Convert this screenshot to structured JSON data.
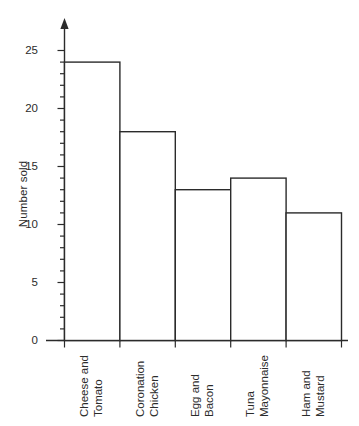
{
  "chart_data": {
    "type": "bar",
    "title": "",
    "xlabel": "",
    "ylabel": "Number sold",
    "categories": [
      "Cheese and Tomato",
      "Coronation Chicken",
      "Egg and Bacon",
      "Tuna Mayonnaise",
      "Ham and Mustard"
    ],
    "category_lines": [
      [
        "Cheese and",
        "Tomato"
      ],
      [
        "Coronation",
        "Chicken"
      ],
      [
        "Egg and",
        "Bacon"
      ],
      [
        "Tuna",
        "Mayonnaise"
      ],
      [
        "Ham and",
        "Mustard"
      ]
    ],
    "values": [
      24,
      18,
      13,
      14,
      11
    ],
    "ylim": [
      0,
      25
    ],
    "y_major_ticks": [
      0,
      5,
      10,
      15,
      20,
      25
    ],
    "y_tick_labels": [
      "0",
      "5",
      "10",
      "15",
      "20",
      "25"
    ],
    "y_minor_tick_step": 1,
    "grid": false,
    "legend": null,
    "bar_fill": "#ffffff",
    "bar_stroke": "#2b2b2b",
    "axis_color": "#2b2b2b",
    "background": "#ffffff",
    "y_axis_has_arrow": true,
    "category_label_rotation_deg": -90
  }
}
